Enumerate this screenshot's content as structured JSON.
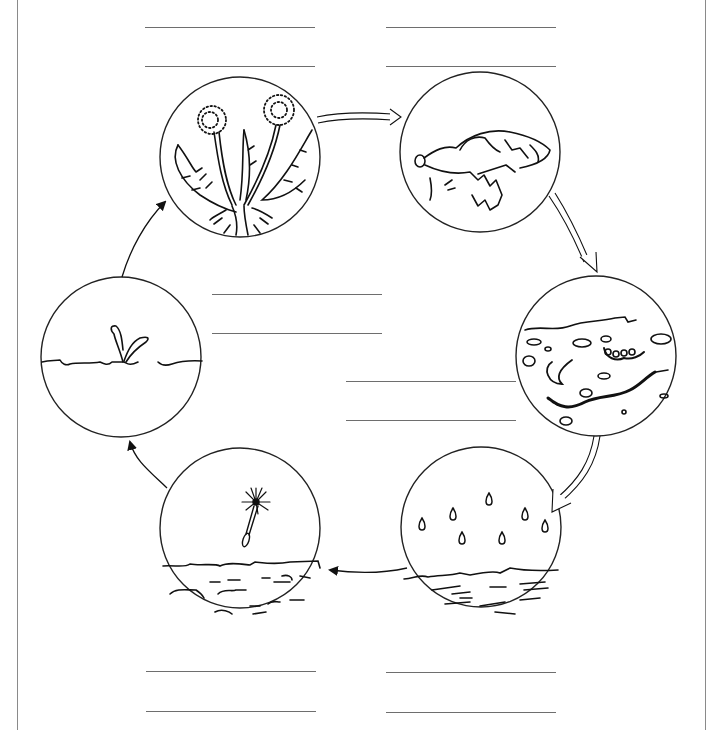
{
  "diagram": {
    "type": "life-cycle",
    "stages": [
      {
        "id": 1,
        "name": "mature-dandelion",
        "description": "Dandelion plant with seed heads (puffballs) and toothed leaves",
        "center": [
          240,
          157
        ],
        "radius": 80,
        "label_lines": [
          {
            "x": 145,
            "y": 27,
            "w": 170,
            "answer": ""
          },
          {
            "x": 145,
            "y": 66,
            "w": 170,
            "answer": ""
          }
        ]
      },
      {
        "id": 2,
        "name": "dying-plant",
        "description": "Wilted, dead dandelion leaves lying on the ground",
        "center": [
          480,
          152
        ],
        "radius": 80,
        "label_lines": [
          {
            "x": 386,
            "y": 27,
            "w": 170,
            "answer": ""
          },
          {
            "x": 386,
            "y": 66,
            "w": 170,
            "answer": ""
          }
        ]
      },
      {
        "id": 3,
        "name": "decomposition",
        "description": "Soil cross-section with earthworm and grub decomposing matter",
        "center": [
          596,
          356
        ],
        "radius": 80,
        "label_lines": [
          {
            "x": 346,
            "y": 381,
            "w": 170,
            "answer": ""
          },
          {
            "x": 346,
            "y": 420,
            "w": 170,
            "answer": ""
          }
        ]
      },
      {
        "id": 4,
        "name": "rain",
        "description": "Raindrops falling onto soil",
        "center": [
          481,
          527
        ],
        "radius": 80,
        "label_lines": [
          {
            "x": 386,
            "y": 672,
            "w": 170,
            "answer": ""
          },
          {
            "x": 386,
            "y": 712,
            "w": 170,
            "answer": ""
          }
        ]
      },
      {
        "id": 5,
        "name": "seed-landing",
        "description": "Dandelion seed with pappus floating down to the soil",
        "center": [
          240,
          528
        ],
        "radius": 80,
        "label_lines": [
          {
            "x": 146,
            "y": 671,
            "w": 170,
            "answer": ""
          },
          {
            "x": 146,
            "y": 711,
            "w": 170,
            "answer": ""
          }
        ]
      },
      {
        "id": 6,
        "name": "sprouting",
        "description": "Small seedling sprouting from the ground",
        "center": [
          121,
          357
        ],
        "radius": 80,
        "label_lines": [
          {
            "x": 212,
            "y": 294,
            "w": 170,
            "answer": ""
          },
          {
            "x": 212,
            "y": 333,
            "w": 170,
            "answer": ""
          }
        ]
      }
    ],
    "arrows": [
      {
        "from": 1,
        "to": 2,
        "style": "hollow-double"
      },
      {
        "from": 2,
        "to": 3,
        "style": "hollow-double"
      },
      {
        "from": 3,
        "to": 4,
        "style": "hollow-double"
      },
      {
        "from": 4,
        "to": 5,
        "style": "solid-line"
      },
      {
        "from": 5,
        "to": 6,
        "style": "solid-line"
      },
      {
        "from": 6,
        "to": 1,
        "style": "solid-line"
      }
    ],
    "colors": {
      "ink": "#111111",
      "line": "#6e6e6e",
      "border": "#8a8a8a",
      "background": "#ffffff"
    }
  }
}
